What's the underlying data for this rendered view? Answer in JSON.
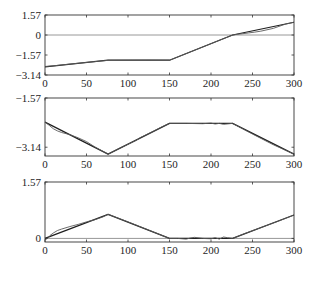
{
  "figure": {
    "background": "#ffffff",
    "line_color_reference": "#1e1e1e",
    "line_color_estimate": "#5a5a5a",
    "zero_line_color": "#8c8c8c",
    "frame_color": "#333333"
  },
  "chart_data": [
    {
      "type": "line",
      "title": "",
      "xlabel": "",
      "ylabel": "",
      "xlim": [
        0,
        300
      ],
      "ylim": [
        -3.14,
        1.57
      ],
      "xticks": [
        0,
        50,
        100,
        150,
        200,
        250,
        300
      ],
      "xtick_labels": [
        "0",
        "50",
        "100",
        "150",
        "200",
        "250",
        "300"
      ],
      "yticks": [
        1.57,
        0,
        -1.57,
        -3.14
      ],
      "ytick_labels": [
        "1.57",
        "0",
        "−1.57",
        "−3.14"
      ],
      "hlines": [
        0
      ],
      "grid": false,
      "legend": null,
      "series": [
        {
          "name": "reference",
          "x": [
            0,
            76,
            150,
            226,
            300
          ],
          "y": [
            -2.51,
            -1.98,
            -1.98,
            0.0,
            1.0
          ]
        },
        {
          "name": "estimate",
          "x": [
            0,
            10,
            20,
            40,
            60,
            76,
            100,
            125,
            150,
            175,
            200,
            215,
            226,
            232,
            238,
            245,
            252,
            260,
            275,
            290,
            300
          ],
          "y": [
            -2.47,
            -2.42,
            -2.35,
            -2.22,
            -2.09,
            -1.99,
            -1.98,
            -1.97,
            -1.98,
            -1.33,
            -0.68,
            -0.29,
            -0.01,
            0.06,
            0.1,
            0.16,
            0.22,
            0.3,
            0.52,
            0.86,
            1.0
          ]
        }
      ]
    },
    {
      "type": "line",
      "title": "",
      "xlabel": "",
      "ylabel": "",
      "xlim": [
        0,
        300
      ],
      "ylim": [
        -3.42,
        -1.57
      ],
      "xticks": [
        0,
        50,
        100,
        150,
        200,
        250,
        300
      ],
      "xtick_labels": [
        "0",
        "50",
        "100",
        "150",
        "200",
        "250",
        "300"
      ],
      "yticks": [
        -1.57,
        -3.14
      ],
      "ytick_labels": [
        "−1.57",
        "−3.14"
      ],
      "hlines": [],
      "grid": false,
      "legend": null,
      "series": [
        {
          "name": "reference",
          "x": [
            0,
            76,
            150,
            226,
            300
          ],
          "y": [
            -2.34,
            -3.36,
            -2.38,
            -2.38,
            -3.36
          ]
        },
        {
          "name": "estimate",
          "x": [
            0,
            5,
            10,
            15,
            20,
            30,
            40,
            50,
            60,
            76,
            90,
            110,
            115,
            130,
            140,
            150,
            170,
            190,
            200,
            205,
            210,
            215,
            226,
            250,
            275,
            300
          ],
          "y": [
            -2.34,
            -2.44,
            -2.55,
            -2.62,
            -2.67,
            -2.74,
            -2.84,
            -2.96,
            -3.13,
            -3.36,
            -3.17,
            -2.92,
            -2.83,
            -2.64,
            -2.5,
            -2.38,
            -2.38,
            -2.39,
            -2.37,
            -2.4,
            -2.38,
            -2.41,
            -2.38,
            -2.72,
            -3.06,
            -3.36
          ]
        }
      ]
    },
    {
      "type": "line",
      "title": "",
      "xlabel": "",
      "ylabel": "",
      "xlim": [
        0,
        300
      ],
      "ylim": [
        -0.1,
        1.57
      ],
      "xticks": [
        0,
        50,
        100,
        150,
        200,
        250,
        300
      ],
      "xtick_labels": [
        "0",
        "50",
        "100",
        "150",
        "200",
        "250",
        "300"
      ],
      "yticks": [
        1.57,
        0
      ],
      "ytick_labels": [
        "1.57",
        "0"
      ],
      "hlines": [
        0
      ],
      "grid": false,
      "legend": null,
      "series": [
        {
          "name": "reference",
          "x": [
            0,
            76,
            150,
            226,
            300
          ],
          "y": [
            0.0,
            0.67,
            0.0,
            0.0,
            0.65
          ]
        },
        {
          "name": "estimate",
          "x": [
            0,
            3,
            6,
            10,
            15,
            20,
            30,
            40,
            50,
            60,
            70,
            76,
            100,
            125,
            150,
            160,
            170,
            175,
            180,
            190,
            200,
            205,
            210,
            215,
            220,
            226,
            240,
            260,
            280,
            300
          ],
          "y": [
            -0.04,
            0.0,
            0.08,
            0.15,
            0.22,
            0.26,
            0.33,
            0.39,
            0.46,
            0.52,
            0.6,
            0.67,
            0.46,
            0.23,
            0.0,
            0.0,
            -0.02,
            0.01,
            0.03,
            0.0,
            -0.01,
            0.02,
            -0.02,
            0.04,
            0.02,
            0.0,
            0.13,
            0.3,
            0.47,
            0.65
          ]
        }
      ]
    }
  ]
}
